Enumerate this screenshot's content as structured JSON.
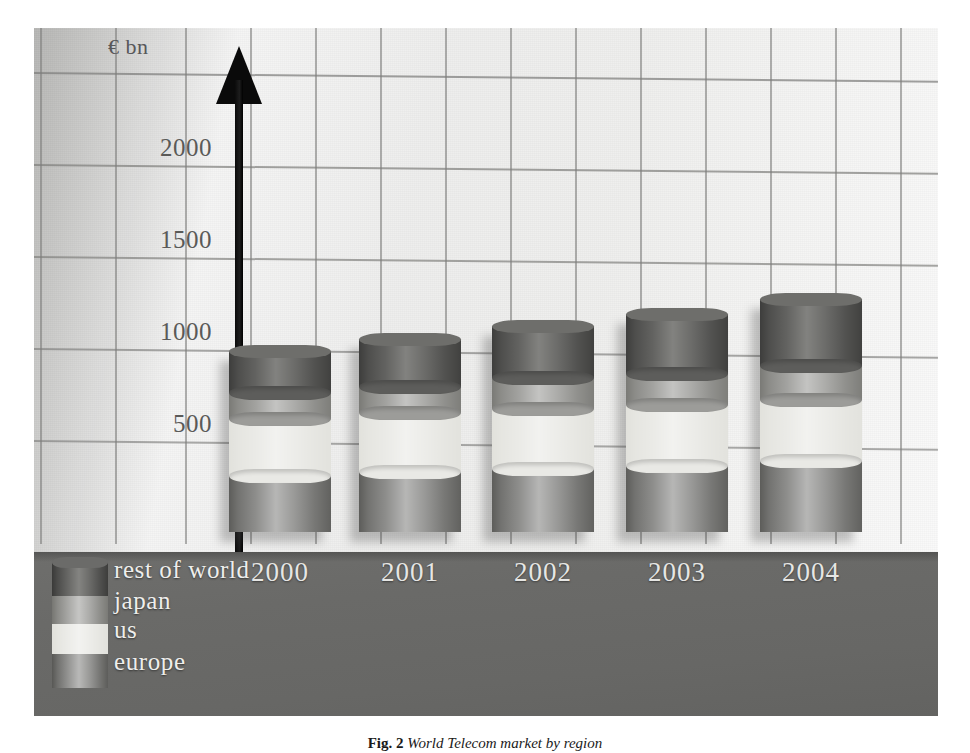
{
  "figure": {
    "caption_label": "Fig. 2",
    "caption_text": "World Telecom market by region",
    "unit_label": "€ bn"
  },
  "axis": {
    "y_ticks": [
      "2000",
      "1500",
      "1000",
      "500"
    ],
    "x_labels": [
      "2000",
      "2001",
      "2002",
      "2003",
      "2004"
    ]
  },
  "legend": {
    "items": [
      {
        "label": "rest of world",
        "color": "#5d5d5b"
      },
      {
        "label": "japan",
        "color": "#9c9c99"
      },
      {
        "label": "us",
        "color": "#e9e9e5"
      },
      {
        "label": "europe",
        "color": "#868684"
      }
    ]
  },
  "colors": {
    "rest_of_world": "#5d5d5b",
    "japan": "#9c9c99",
    "us": "#e9e9e5",
    "europe": "#868684",
    "floor": "#6a6a68",
    "grid": "#7d7d7b",
    "axis_arrow": "#0a0a0a",
    "plot_background": "#d2d2d0"
  },
  "chart_data": {
    "type": "bar",
    "title": "World Telecom market by region",
    "subtitle": "",
    "xlabel": "",
    "ylabel": "€ bn",
    "ylim": [
      0,
      2500
    ],
    "yticks": [
      500,
      1000,
      1500,
      2000
    ],
    "grid": true,
    "stacked": true,
    "legend_position": "bottom-left",
    "categories": [
      "2000",
      "2001",
      "2002",
      "2003",
      "2004"
    ],
    "series": [
      {
        "name": "europe",
        "values": [
          305,
          325,
          340,
          360,
          385
        ]
      },
      {
        "name": "us",
        "values": [
          310,
          320,
          330,
          330,
          330
        ]
      },
      {
        "name": "japan",
        "values": [
          140,
          145,
          165,
          170,
          185
        ]
      },
      {
        "name": "rest of world",
        "values": [
          230,
          260,
          285,
          325,
          365
        ]
      }
    ],
    "totals": [
      985,
      1050,
      1120,
      1185,
      1265
    ]
  }
}
